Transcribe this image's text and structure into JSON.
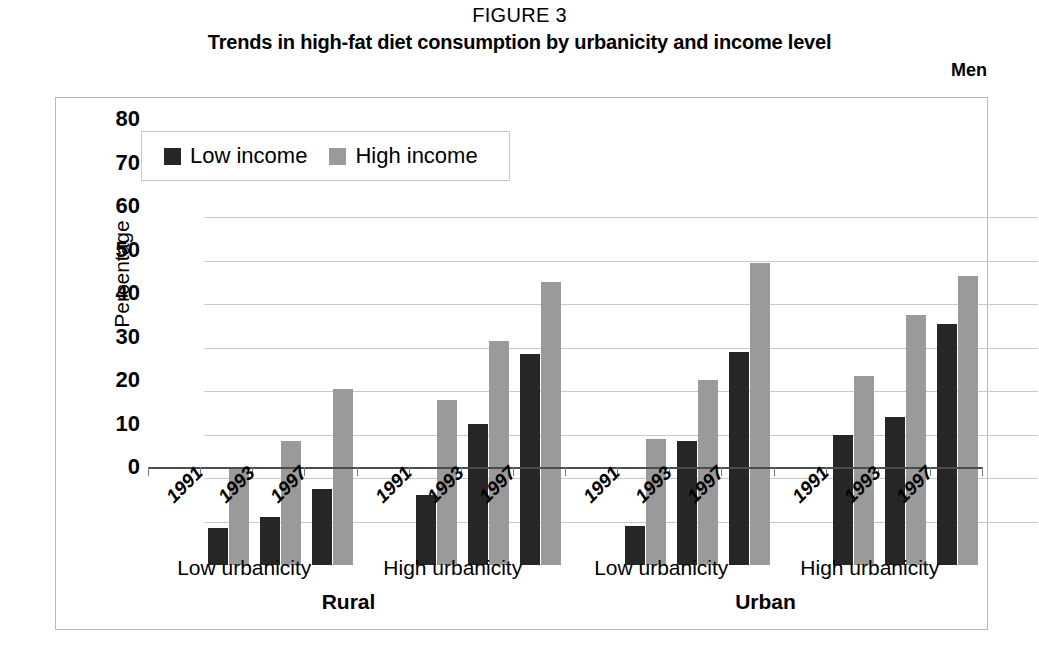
{
  "figure": {
    "label": "FIGURE 3",
    "title": "Trends in high-fat diet consumption by urbanicity and income level",
    "panel": "Men"
  },
  "legend": {
    "position": "top-left-inside",
    "items": [
      {
        "label": "Low income",
        "color": "#262626"
      },
      {
        "label": "High income",
        "color": "#9a9a9a"
      }
    ]
  },
  "chart_data": {
    "type": "bar",
    "title": "Trends in high-fat diet consumption by urbanicity and income level",
    "subtitle": "Men",
    "xlabel": "",
    "ylabel": "Percentage",
    "ylim": [
      0,
      80
    ],
    "yticks": [
      0,
      10,
      20,
      30,
      40,
      50,
      60,
      70,
      80
    ],
    "grid": true,
    "categories": [
      "1991",
      "1993",
      "1997"
    ],
    "groups": [
      {
        "region": "Rural",
        "urbanicity": "Low urbanicity",
        "series": [
          {
            "name": "Low income",
            "color": "#262626",
            "values": [
              8.5,
              11.0,
              17.5
            ]
          },
          {
            "name": "High income",
            "color": "#9a9a9a",
            "values": [
              22.0,
              28.5,
              40.5
            ]
          }
        ]
      },
      {
        "region": "Rural",
        "urbanicity": "High urbanicity",
        "series": [
          {
            "name": "Low income",
            "color": "#262626",
            "values": [
              16.0,
              32.5,
              48.5
            ]
          },
          {
            "name": "High income",
            "color": "#9a9a9a",
            "values": [
              38.0,
              51.5,
              65.0
            ]
          }
        ]
      },
      {
        "region": "Urban",
        "urbanicity": "Low urbanicity",
        "series": [
          {
            "name": "Low income",
            "color": "#262626",
            "values": [
              9.0,
              28.5,
              49.0
            ]
          },
          {
            "name": "High income",
            "color": "#9a9a9a",
            "values": [
              29.0,
              42.5,
              69.5
            ]
          }
        ]
      },
      {
        "region": "Urban",
        "urbanicity": "High urbanicity",
        "series": [
          {
            "name": "Low income",
            "color": "#262626",
            "values": [
              30.0,
              34.0,
              55.5
            ]
          },
          {
            "name": "High income",
            "color": "#9a9a9a",
            "values": [
              43.5,
              57.5,
              66.5
            ]
          }
        ]
      }
    ],
    "region_labels": [
      "Rural",
      "Urban"
    ],
    "urbanicity_labels": [
      "Low urbanicity",
      "High urbanicity",
      "Low urbanicity",
      "High urbanicity"
    ]
  }
}
